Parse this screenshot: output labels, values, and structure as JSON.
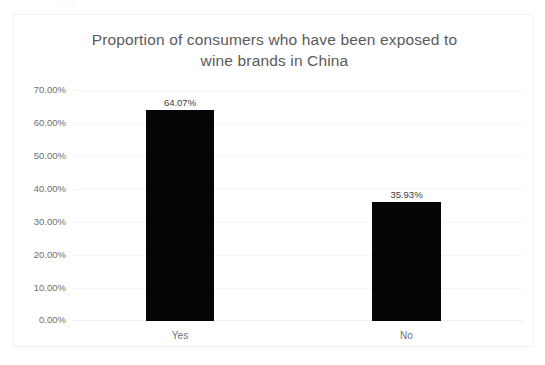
{
  "page": {
    "top_remnant_text": "·   ·                ·"
  },
  "chart_data": {
    "type": "bar",
    "title": "Proportion of consumers who have been exposed to wine brands in China",
    "title_lines": [
      "Proportion of consumers who have been exposed to",
      "wine brands in China"
    ],
    "xlabel": "",
    "ylabel": "",
    "categories": [
      "Yes",
      "No"
    ],
    "values": [
      64.07,
      35.93
    ],
    "value_labels": [
      "64.07%",
      "35.93%"
    ],
    "ylim": [
      0,
      70
    ],
    "ytick_values": [
      70,
      60,
      50,
      40,
      30,
      20,
      10,
      0
    ],
    "ytick_labels": [
      "70.00%",
      "60.00%",
      "50.00%",
      "40.00%",
      "30.00%",
      "20.00%",
      "10.00%",
      "0.00%"
    ],
    "grid": true,
    "legend": false,
    "bar_color": "#050505",
    "title_color": "#5a5a5a",
    "tick_color": "#6f6f6f",
    "gridline_color": "#f4f4f6",
    "plot_background": "#ffffff"
  }
}
